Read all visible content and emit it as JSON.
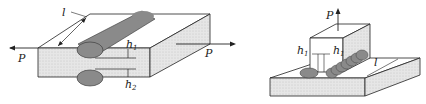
{
  "figure": {
    "left": {
      "title": "Lap joint with transverse fillet welds",
      "labels": {
        "length": "l",
        "force_left": "P",
        "force_right": "P",
        "leg1": "h",
        "leg1_sub": "1",
        "leg2": "h",
        "leg2_sub": "2"
      }
    },
    "right": {
      "title": "T-joint with fillet welds",
      "labels": {
        "force_up": "P",
        "leg_left": "h",
        "leg_left_sub": "1",
        "leg_right": "h",
        "leg_right_sub": "1",
        "length": "l"
      }
    },
    "colors": {
      "plate_face": "#e4e4e4",
      "plate_side": "#f2f2f2",
      "weld": "#8a8a8a",
      "stroke": "#222222"
    }
  }
}
